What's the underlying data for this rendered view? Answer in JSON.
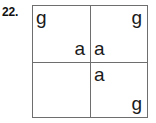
{
  "question": {
    "number_label": "22."
  },
  "diagram": {
    "kind": "punnett-square",
    "rows": 2,
    "columns": 2,
    "border_color": "#6e6e6e",
    "background_color": "#ffffff",
    "text_color": "#1a1a1a",
    "cells": [
      {
        "name": "top-left",
        "alleles": [
          {
            "position": "top-left",
            "letter": "g"
          },
          {
            "position": "bottom-right",
            "letter": "a"
          }
        ]
      },
      {
        "name": "top-right",
        "alleles": [
          {
            "position": "top-right",
            "letter": "g"
          },
          {
            "position": "bottom-left",
            "letter": "a"
          }
        ]
      },
      {
        "name": "bottom-left",
        "alleles": [
          {
            "position": "top-left",
            "letter": ""
          },
          {
            "position": "bottom-right",
            "letter": ""
          }
        ]
      },
      {
        "name": "bottom-right",
        "alleles": [
          {
            "position": "top-left",
            "letter": "a"
          },
          {
            "position": "bottom-right",
            "letter": "g"
          }
        ]
      }
    ]
  }
}
